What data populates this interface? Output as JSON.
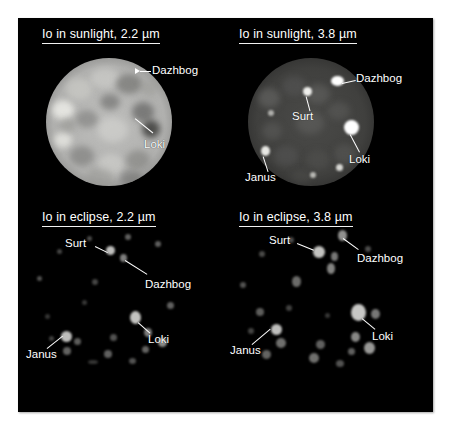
{
  "figure": {
    "background_color": "#ffffff",
    "plate_color": "#000000",
    "label_color": "#ffffff"
  },
  "panels": [
    {
      "id": "sunlight-22",
      "title": "Io in sunlight, 2.2 µm",
      "condition": "sunlight",
      "wavelength": "2.2 µm",
      "annotations": [
        {
          "name": "Dazhbog",
          "label": "Dazhbog"
        },
        {
          "name": "Loki",
          "label": "Loki"
        }
      ]
    },
    {
      "id": "sunlight-38",
      "title": "Io in sunlight, 3.8 µm",
      "condition": "sunlight",
      "wavelength": "3.8 µm",
      "annotations": [
        {
          "name": "Dazhbog",
          "label": "Dazhbog"
        },
        {
          "name": "Surt",
          "label": "Surt"
        },
        {
          "name": "Loki",
          "label": "Loki"
        },
        {
          "name": "Janus",
          "label": "Janus"
        }
      ]
    },
    {
      "id": "eclipse-22",
      "title": "Io in eclipse, 2.2 µm",
      "condition": "eclipse",
      "wavelength": "2.2 µm",
      "annotations": [
        {
          "name": "Surt",
          "label": "Surt"
        },
        {
          "name": "Dazhbog",
          "label": "Dazhbog"
        },
        {
          "name": "Loki",
          "label": "Loki"
        },
        {
          "name": "Janus",
          "label": "Janus"
        }
      ]
    },
    {
      "id": "eclipse-38",
      "title": "Io in eclipse, 3.8 µm",
      "condition": "eclipse",
      "wavelength": "3.8 µm",
      "annotations": [
        {
          "name": "Surt",
          "label": "Surt"
        },
        {
          "name": "Dazhbog",
          "label": "Dazhbog"
        },
        {
          "name": "Loki",
          "label": "Loki"
        },
        {
          "name": "Janus",
          "label": "Janus"
        }
      ]
    }
  ],
  "labels": {
    "dazhbog": "Dazhbog",
    "loki": "Loki",
    "surt": "Surt",
    "janus": "Janus"
  },
  "titles": {
    "sunlight_22": "Io in sunlight, 2.2 µm",
    "sunlight_38": "Io in sunlight, 3.8 µm",
    "eclipse_22": "Io in eclipse, 2.2 µm",
    "eclipse_38": "Io in eclipse, 3.8 µm"
  }
}
